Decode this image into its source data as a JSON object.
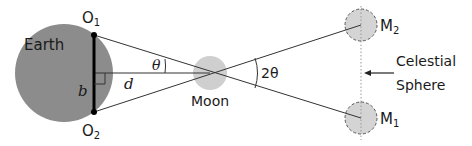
{
  "diagram": {
    "labels": {
      "earth": "Earth",
      "moon": "Moon",
      "o1": "O",
      "o1_sub": "1",
      "o2": "O",
      "o2_sub": "2",
      "m1": "M",
      "m1_sub": "1",
      "m2": "M",
      "m2_sub": "2",
      "baseline": "b",
      "distance": "d",
      "theta": "θ",
      "two_theta": "2θ",
      "celestial_line1": "Celestial",
      "celestial_line2": "Sphere"
    },
    "colors": {
      "earth_fill": "#8c8c8c",
      "moon_fill": "#cfcfcf",
      "moon_image_fill": "#d4d4d4",
      "line": "#333333",
      "baseline": "#000000",
      "dotted": "#999999"
    }
  }
}
